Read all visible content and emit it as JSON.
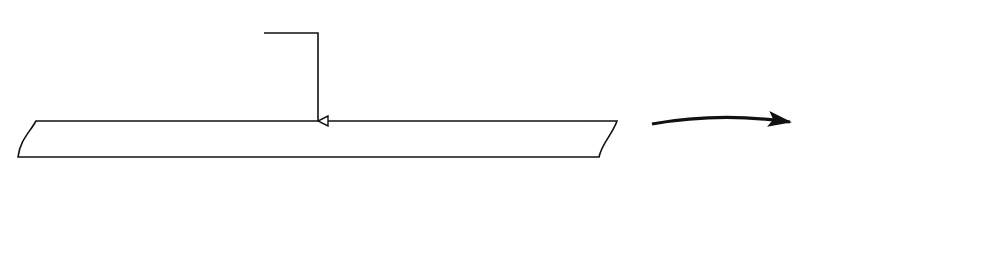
{
  "diagram": {
    "type": "turing-machine-tape-to-two-stacks",
    "tape": {
      "cells": [
        "□",
        "a",
        "b",
        "a",
        "a",
        "b",
        "b",
        "b",
        "a",
        "b",
        "b",
        "b",
        "□",
        "□",
        "□"
      ],
      "head_index": 7,
      "head_label": "Kopf"
    },
    "transform_arrow": {
      "direction": "right"
    },
    "stacks": [
      {
        "name": "left-stack",
        "cells_top_to_bottom": [
          "b",
          "b",
          "a",
          "a",
          "b",
          "a",
          "$"
        ]
      },
      {
        "name": "right-stack",
        "cells_top_to_bottom": [
          "b",
          "a",
          "b",
          "b",
          "b",
          "$"
        ]
      }
    ],
    "colors": {
      "ink": "#111111",
      "background": "#ffffff"
    }
  }
}
